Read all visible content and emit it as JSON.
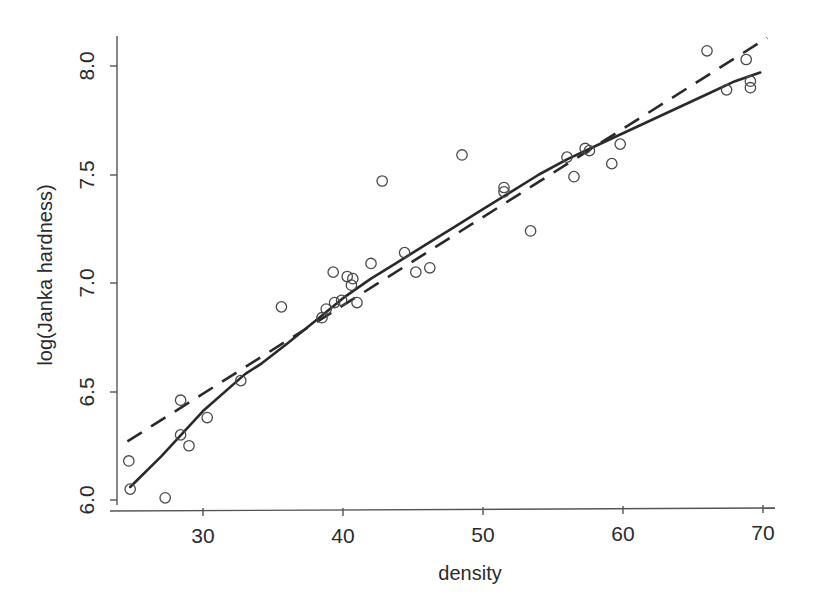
{
  "chart_data": {
    "type": "scatter",
    "title": "",
    "subtitle": "",
    "xlabel": "density",
    "ylabel": "log(Janka hardness)",
    "xlim": [
      23.5,
      71.0
    ],
    "ylim": [
      5.93,
      8.22
    ],
    "xticks": [
      30,
      40,
      50,
      60,
      70
    ],
    "xtick_labels": [
      "30",
      "40",
      "50",
      "60",
      "70"
    ],
    "yticks": [
      6.0,
      6.5,
      7.0,
      7.5,
      8.0
    ],
    "ytick_labels": [
      "6.0",
      "6.5",
      "7.0",
      "7.5",
      "8.0"
    ],
    "grid": false,
    "legend": "none",
    "point_marker": "open-circle",
    "point_color": "#4a4a4a",
    "line_color": "#2a2a2a",
    "background": "#ffffff",
    "x": [
      24.7,
      24.8,
      27.3,
      28.4,
      28.4,
      29.0,
      30.3,
      32.7,
      35.6,
      38.5,
      38.8,
      39.3,
      39.4,
      39.9,
      40.3,
      40.6,
      40.7,
      41.0,
      42.0,
      45.2,
      44.4,
      46.2,
      42.8,
      48.5,
      51.5,
      51.5,
      53.4,
      56.0,
      56.5,
      57.3,
      57.6,
      59.2,
      59.8,
      66.0,
      67.4,
      68.8,
      69.1,
      69.1
    ],
    "y": [
      6.18,
      6.05,
      6.01,
      6.46,
      6.3,
      6.25,
      6.38,
      6.55,
      6.89,
      6.84,
      6.88,
      7.05,
      6.91,
      6.92,
      7.03,
      6.99,
      7.02,
      6.91,
      7.09,
      7.05,
      7.14,
      7.07,
      7.47,
      7.59,
      7.44,
      7.42,
      7.24,
      7.58,
      7.49,
      7.62,
      7.61,
      7.55,
      7.64,
      8.07,
      7.89,
      8.03,
      7.93,
      7.9
    ],
    "series": [
      {
        "name": "linear-fit",
        "style": "dashed",
        "x": [
          24.6,
          70.3
        ],
        "y": [
          6.27,
          8.13
        ]
      },
      {
        "name": "smooth-fit",
        "style": "solid",
        "x": [
          24.8,
          27.0,
          30.0,
          33.0,
          34.2,
          36.0,
          38.5,
          40.0,
          42.0,
          44.0,
          46.0,
          48.0,
          50.0,
          52.0,
          54.0,
          56.0,
          58.0,
          60.0,
          62.0,
          64.0,
          66.0,
          68.0,
          69.8
        ],
        "y": [
          6.06,
          6.2,
          6.41,
          6.58,
          6.63,
          6.72,
          6.85,
          6.93,
          7.02,
          7.1,
          7.18,
          7.26,
          7.34,
          7.42,
          7.5,
          7.57,
          7.63,
          7.69,
          7.75,
          7.81,
          7.87,
          7.93,
          7.97
        ]
      }
    ]
  },
  "axes": {
    "x_title": "density",
    "y_title": "log(Janka hardness)"
  }
}
